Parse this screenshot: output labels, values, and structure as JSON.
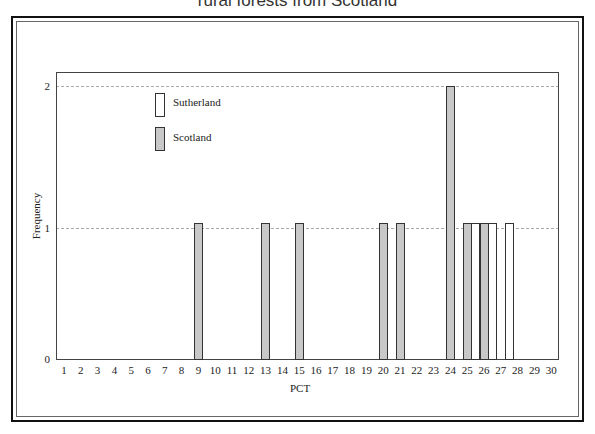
{
  "title": "rural forests from Scotland",
  "chart_data": {
    "type": "bar",
    "title": "rural forests from Scotland",
    "xlabel": "PCT",
    "ylabel": "Frequency",
    "x_ticks": [
      1,
      2,
      3,
      4,
      5,
      6,
      7,
      8,
      9,
      10,
      11,
      12,
      13,
      14,
      15,
      16,
      17,
      18,
      19,
      20,
      21,
      22,
      23,
      24,
      25,
      26,
      27,
      28,
      29,
      30
    ],
    "y_ticks": [
      0,
      1,
      2
    ],
    "xlim": [
      1,
      30
    ],
    "ylim": [
      0,
      2.1
    ],
    "grid": "horizontal dashed at y=1,2",
    "legend": {
      "position": "upper-left inside",
      "entries": [
        "Sutherland",
        "Scotland"
      ]
    },
    "series": [
      {
        "name": "Scotland",
        "color": "#c8c8c8",
        "points": [
          {
            "x": 9,
            "y": 1
          },
          {
            "x": 13,
            "y": 1
          },
          {
            "x": 15,
            "y": 1
          },
          {
            "x": 20,
            "y": 1
          },
          {
            "x": 21,
            "y": 1
          },
          {
            "x": 24,
            "y": 2
          },
          {
            "x": 25,
            "y": 1
          },
          {
            "x": 26,
            "y": 1
          }
        ]
      },
      {
        "name": "Sutherland",
        "color": "#ffffff",
        "points": [
          {
            "x": 25.5,
            "y": 1
          },
          {
            "x": 26.5,
            "y": 1
          },
          {
            "x": 27.5,
            "y": 1
          }
        ]
      }
    ]
  },
  "legend": {
    "sutherland": "Sutherland",
    "scotland": "Scotland"
  },
  "axes": {
    "xlabel": "PCT",
    "ylabel": "Frequency",
    "y_ticks": [
      "0",
      "1",
      "2"
    ],
    "x_ticks": [
      "1",
      "2",
      "3",
      "4",
      "5",
      "6",
      "7",
      "8",
      "9",
      "10",
      "11",
      "12",
      "13",
      "14",
      "15",
      "16",
      "17",
      "18",
      "19",
      "20",
      "21",
      "22",
      "23",
      "24",
      "25",
      "26",
      "27",
      "28",
      "29",
      "30"
    ]
  }
}
